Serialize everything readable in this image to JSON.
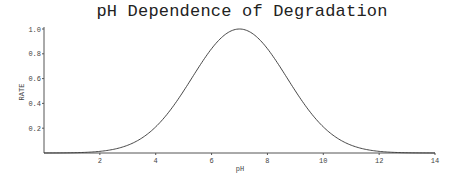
{
  "chart_data": {
    "type": "line",
    "title": "pH Dependence of Degradation",
    "xlabel": "pH",
    "ylabel": "RATE",
    "xlim": [
      0,
      14
    ],
    "ylim": [
      0,
      1.0
    ],
    "x_ticks": [
      2,
      4,
      6,
      8,
      10,
      12,
      14
    ],
    "y_ticks": [
      "0.2",
      "0.4",
      "0.6",
      "0.8",
      "1.0"
    ],
    "grid": false,
    "legend": null,
    "series": [
      {
        "name": "rate",
        "description": "Gaussian-shaped curve peaking at pH 7 with rate 1.0 (sigma ~1.7)",
        "x": [
          0,
          1,
          2,
          3,
          4,
          5,
          6,
          6.5,
          7,
          7.5,
          8,
          9,
          10,
          11,
          12,
          13,
          14
        ],
        "y": [
          0.0,
          0.002,
          0.013,
          0.063,
          0.211,
          0.501,
          0.841,
          0.958,
          1.0,
          0.958,
          0.841,
          0.501,
          0.211,
          0.063,
          0.013,
          0.002,
          0.0
        ]
      }
    ],
    "peak": {
      "x": 7,
      "y": 1.0
    },
    "sigma": 1.7
  }
}
